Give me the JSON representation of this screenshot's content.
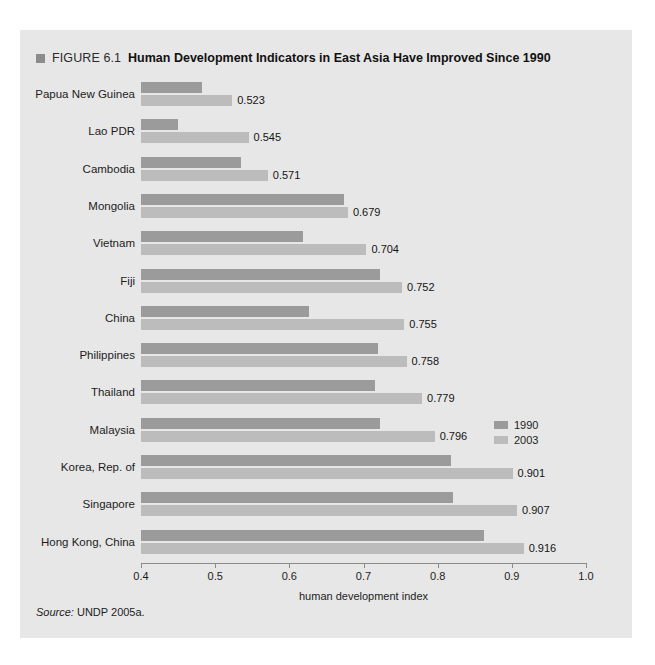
{
  "figure": {
    "marker_icon": "square-marker-icon",
    "number": "FIGURE 6.1",
    "title": "Human Development Indicators in East Asia Have Improved Since 1990"
  },
  "source": {
    "label": "Source:",
    "text": "UNDP 2005a."
  },
  "legend": {
    "position": "middle-right",
    "items": [
      {
        "label": "1990",
        "color": "#9b9b9b"
      },
      {
        "label": "2003",
        "color": "#bcbcbc"
      }
    ]
  },
  "colors": {
    "panel_background": "#e7e7e7",
    "page_background": "#ffffff",
    "bar_1990": "#9b9b9b",
    "bar_2003": "#bcbcbc",
    "axis": "#8a8a8a",
    "text": "#1d1d1d",
    "marker": "#8c8c8c"
  },
  "chart_data": {
    "type": "bar",
    "orientation": "horizontal",
    "title": "Human Development Indicators in East Asia Have Improved Since 1990",
    "subtitle": "",
    "xlabel": "human development index",
    "ylabel": "",
    "xlim": [
      0.4,
      1.0
    ],
    "xticks": [
      0.4,
      0.5,
      0.6,
      0.7,
      0.8,
      0.9,
      1.0
    ],
    "xtick_labels": [
      "0.4",
      "0.5",
      "0.6",
      "0.7",
      "0.8",
      "0.9",
      "1.0"
    ],
    "grid": false,
    "legend_position": "middle-right",
    "categories": [
      "Papua New Guinea",
      "Lao PDR",
      "Cambodia",
      "Mongolia",
      "Vietnam",
      "Fiji",
      "China",
      "Philippines",
      "Thailand",
      "Malaysia",
      "Korea, Rep. of",
      "Singapore",
      "Hong Kong, China"
    ],
    "series": [
      {
        "name": "1990",
        "color": "#9b9b9b",
        "values": [
          0.482,
          0.45,
          0.535,
          0.674,
          0.618,
          0.722,
          0.627,
          0.72,
          0.715,
          0.722,
          0.818,
          0.821,
          0.862
        ],
        "labels": [
          "",
          "",
          "",
          "",
          "",
          "",
          "",
          "",
          "",
          "",
          "",
          "",
          ""
        ]
      },
      {
        "name": "2003",
        "color": "#bcbcbc",
        "values": [
          0.523,
          0.545,
          0.571,
          0.679,
          0.704,
          0.752,
          0.755,
          0.758,
          0.779,
          0.796,
          0.901,
          0.907,
          0.916
        ],
        "labels": [
          "0.523",
          "0.545",
          "0.571",
          "0.679",
          "0.704",
          "0.752",
          "0.755",
          "0.758",
          "0.779",
          "0.796",
          "0.901",
          "0.907",
          "0.916"
        ]
      }
    ]
  }
}
